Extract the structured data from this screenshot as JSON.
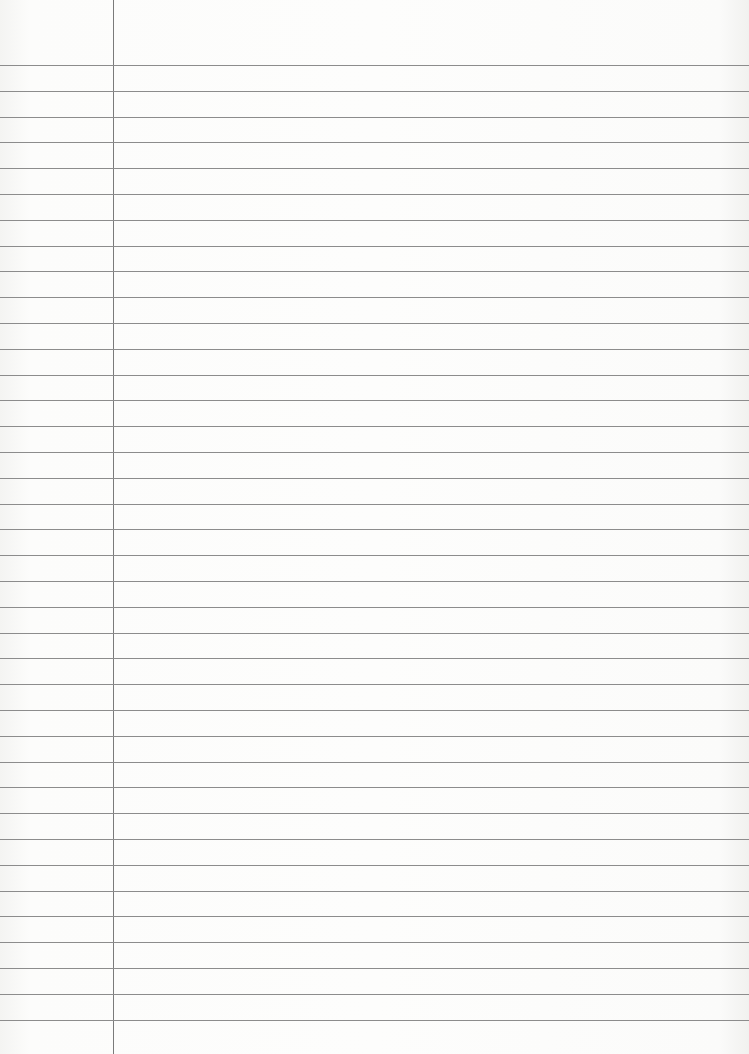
{
  "paper": {
    "type": "lined-paper",
    "line_count": 38,
    "first_line_y": 65,
    "line_spacing": 25.8,
    "margin_x": 113,
    "line_color": "#8c8c8c",
    "margin_color": "#7a7a7a",
    "background": "#fbfbfa"
  }
}
